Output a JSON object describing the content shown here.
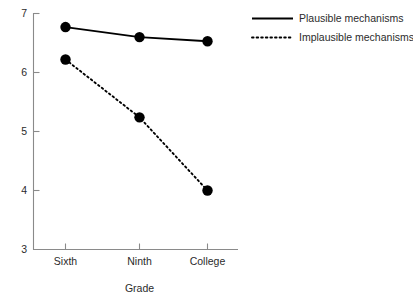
{
  "chart_data": {
    "type": "line",
    "title": "",
    "subtitle": "",
    "xlabel": "Grade",
    "ylabel": "",
    "categories": [
      "Sixth",
      "Ninth",
      "College"
    ],
    "series": [
      {
        "name": "Plausible mechanisms",
        "style": "solid",
        "values": [
          6.77,
          6.6,
          6.53
        ]
      },
      {
        "name": "Implausible mechanisms",
        "style": "dotted",
        "values": [
          6.22,
          5.24,
          4.0
        ]
      }
    ],
    "ylim": [
      3,
      7
    ],
    "yticks": [
      "3",
      "4",
      "5",
      "6",
      "7"
    ],
    "ytick_values": [
      3,
      4,
      5,
      6,
      7
    ],
    "xticks": [
      "Sixth",
      "Ninth",
      "College"
    ],
    "grid": false,
    "legend_position": "top-right",
    "marker": "filled-circle",
    "colors": {
      "series": "#000000",
      "axis": "#8a8a8a",
      "text": "#2b2b2b",
      "background": "#ffffff"
    }
  },
  "axes": {
    "y_tick_labels": [
      "7",
      "6",
      "5",
      "4",
      "3"
    ],
    "x_tick_labels": [
      "Sixth",
      "Ninth",
      "College"
    ],
    "x_axis_title": "Grade"
  },
  "legend": {
    "items": [
      {
        "label": "Plausible mechanisms",
        "style": "solid"
      },
      {
        "label": "Implausible mechanisms",
        "style": "dotted"
      }
    ]
  }
}
